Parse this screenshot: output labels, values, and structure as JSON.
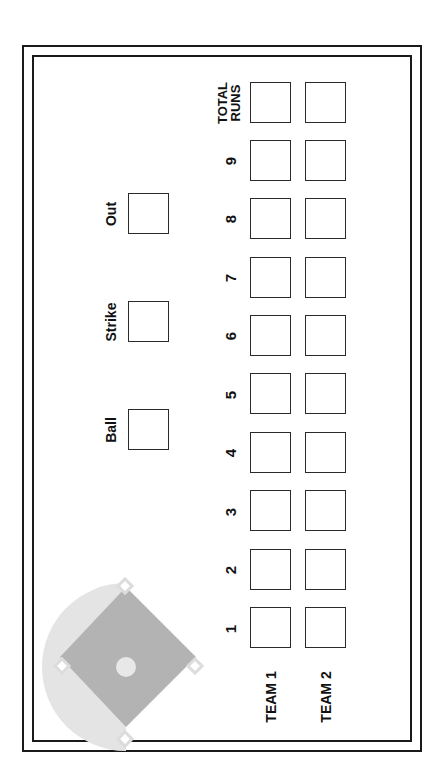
{
  "count": {
    "ball_label": "Ball",
    "strike_label": "Strike",
    "out_label": "Out"
  },
  "innings": [
    "1",
    "2",
    "3",
    "4",
    "5",
    "6",
    "7",
    "8",
    "9"
  ],
  "total": {
    "line1": "TOTAL",
    "line2": "RUNS"
  },
  "teams": [
    {
      "label": "TEAM 1",
      "scores": [
        "",
        "",
        "",
        "",
        "",
        "",
        "",
        "",
        "",
        ""
      ]
    },
    {
      "label": "TEAM 2",
      "scores": [
        "",
        "",
        "",
        "",
        "",
        "",
        "",
        "",
        "",
        ""
      ]
    }
  ],
  "colors": {
    "border": "#1a1a1a",
    "field_light": "#e4e4e4",
    "infield": "#b3b3b3",
    "mound": "#e8e8e8",
    "base": "#ffffff"
  },
  "icons": {
    "field": "baseball-diamond-icon"
  }
}
